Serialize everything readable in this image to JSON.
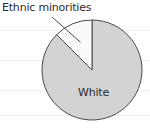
{
  "chart_data": {
    "type": "pie",
    "title": "",
    "xlabel": "",
    "ylabel": "",
    "categories": [
      "White",
      "Ethnic minorities"
    ],
    "values": [
      87.5,
      12.5
    ],
    "unit": "percent",
    "labels_shown": [
      "Ethnic minorities",
      "White"
    ],
    "legend_position": "none",
    "grid": true,
    "gridlines_y": [
      30,
      60,
      90,
      115
    ],
    "start_angle_deg": 90,
    "direction": "counterclockwise",
    "slices": [
      {
        "name": "White",
        "label": "White",
        "value": 87.5,
        "fill": "#d3d3d3",
        "stroke": "#4a4a4a",
        "label_placement": "inside"
      },
      {
        "name": "Ethnic minorities",
        "label": "Ethnic minorities",
        "value": 12.5,
        "fill": "#fafafa",
        "stroke": "#4a4a4a",
        "label_placement": "outside-leader"
      }
    ]
  },
  "figure": {
    "background": "#ffffff",
    "gridline_color": "#f0f0f0",
    "outline_color": "#4a4a4a",
    "text_color": "#2b2b2b",
    "center_x": 92,
    "center_y": 70,
    "radius": 50
  },
  "labels": {
    "ethnic_minorities": "Ethnic minorities",
    "white": "White"
  }
}
